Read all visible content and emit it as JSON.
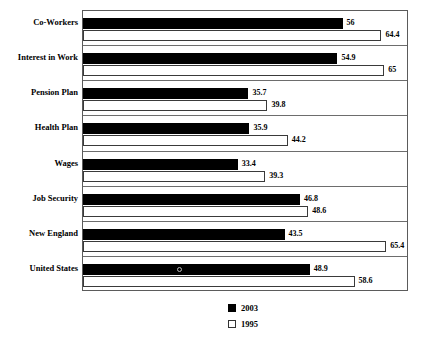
{
  "chart_data": {
    "type": "bar",
    "orientation": "horizontal",
    "title": "",
    "subtitle": "",
    "xlabel": "",
    "ylabel": "",
    "grid": false,
    "xlim": [
      0,
      70
    ],
    "legend_position": "bottom-center",
    "categories": [
      "Co-Workers",
      "Interest in Work",
      "Pension Plan",
      "Health Plan",
      "Wages",
      "Job Security",
      "New England",
      "United States"
    ],
    "series": [
      {
        "name": "2003",
        "color": "#000000",
        "values": [
          56,
          54.9,
          35.7,
          35.9,
          33.4,
          46.8,
          43.5,
          48.9
        ],
        "labels": [
          "56",
          "54.9",
          "35.7",
          "35.9",
          "33.4",
          "46.8",
          "43.5",
          "48.9"
        ]
      },
      {
        "name": "1995",
        "color": "#ffffff",
        "values": [
          64.4,
          65,
          39.8,
          44.2,
          39.3,
          48.6,
          65.4,
          58.6
        ],
        "labels": [
          "64.4",
          "65",
          "39.8",
          "44.2",
          "39.3",
          "48.6",
          "65.4",
          "58.6"
        ]
      }
    ]
  },
  "legend": {
    "items": [
      {
        "label": "2003",
        "swatch": "filled-black-square"
      },
      {
        "label": "1995",
        "swatch": "outlined-white-square"
      }
    ]
  },
  "colors": {
    "series_2003": "#000000",
    "series_1995": "#ffffff",
    "frame": "#5b5b5b",
    "separator": "#6d6d6d",
    "background": "#ffffff"
  }
}
